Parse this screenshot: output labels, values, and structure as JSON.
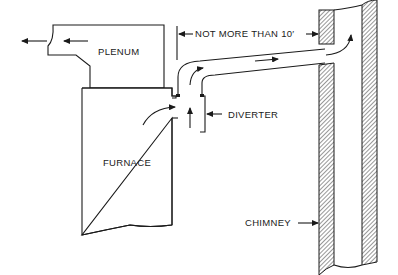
{
  "diagram": {
    "type": "furnace-chimney-connection",
    "labels": {
      "plenum": "PLENUM",
      "furnace": "FURNACE",
      "diverter": "DIVERTER",
      "chimney": "CHIMNEY",
      "distance": "NOT MORE THAN 10′"
    },
    "components": [
      {
        "id": "plenum",
        "label": "PLENUM"
      },
      {
        "id": "furnace",
        "label": "FURNACE"
      },
      {
        "id": "diverter",
        "label": "DIVERTER"
      },
      {
        "id": "flue-pipe",
        "label": ""
      },
      {
        "id": "chimney",
        "label": "CHIMNEY"
      }
    ],
    "annotations": [
      {
        "text": "NOT MORE THAN 10′",
        "type": "dimension",
        "spans": "diverter-to-chimney"
      }
    ],
    "flows": [
      {
        "id": "plenum-outflow",
        "direction": "left"
      },
      {
        "id": "room-air-into-diverter",
        "direction": "right"
      },
      {
        "id": "flue-gas-up",
        "direction": "up"
      },
      {
        "id": "flue-pipe-flow",
        "direction": "right"
      },
      {
        "id": "chimney-up",
        "direction": "up"
      }
    ],
    "colors": {
      "line": "#1a1a1a",
      "background": "#ffffff"
    }
  }
}
